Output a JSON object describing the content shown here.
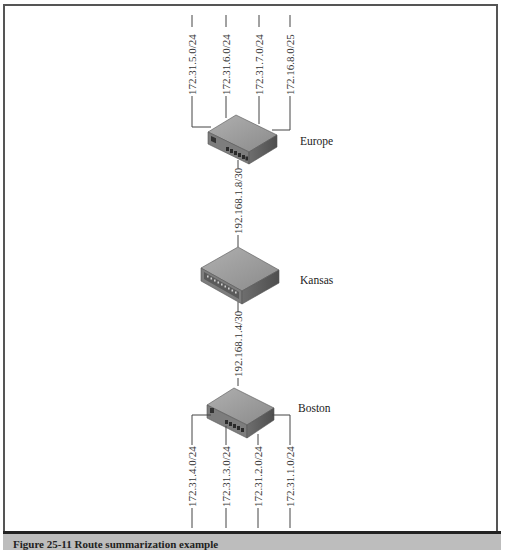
{
  "figure": {
    "caption": "Figure 25-11   Route summarization example",
    "line_color": "#444444",
    "router_top": "#9a9a9a",
    "router_front": "#7a7a7a",
    "router_side": "#5e5e5e"
  },
  "routers": {
    "europe": {
      "label": "Europe",
      "lan_networks": [
        "172.31.5.0/24",
        "172.31.6.0/24",
        "172.31.7.0/24",
        "172.16.8.0/25"
      ]
    },
    "kansas": {
      "label": "Kansas"
    },
    "boston": {
      "label": "Boston",
      "lan_networks": [
        "172.31.4.0/24",
        "172.31.3.0/24",
        "172.31.2.0/24",
        "172.31.1.0/24"
      ]
    }
  },
  "links": {
    "europe_kansas": "192.168.1.8/30",
    "kansas_boston": "192.168.1.4/30"
  }
}
